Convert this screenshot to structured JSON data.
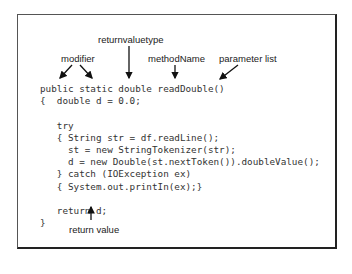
{
  "labels": {
    "modifier": "modifier",
    "return_type": "returnvaluetype",
    "method_name": "methodName",
    "parameter_list": "parameter list",
    "return_value": "return value"
  },
  "code_lines": [
    "public static double readDouble()",
    "{  double d = 0.0;",
    "",
    "   try",
    "   { String str = df.readLine();",
    "     st = new StringTokenizer(str);",
    "     d = new Double(st.nextToken()).doubleValue();",
    "   } catch (IOException ex)",
    "   { System.out.printIn(ex);}",
    "",
    "   return d;",
    "}"
  ]
}
